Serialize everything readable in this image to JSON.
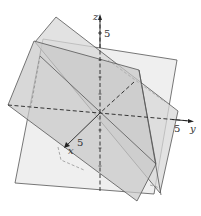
{
  "figure": {
    "type": "3d-planes",
    "axes": {
      "x": {
        "label": "x",
        "tick": "5"
      },
      "y": {
        "label": "y",
        "tick": "5"
      },
      "z": {
        "label": "z",
        "tick": "5"
      }
    },
    "colors": {
      "plane_light": "#ececec",
      "plane_mid": "#d6d6d6",
      "plane_dark": "#c4c4c4",
      "edge": "#555555",
      "axis": "#222222"
    }
  }
}
